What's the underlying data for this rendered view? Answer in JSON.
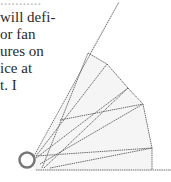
{
  "text_lines": [
    "...........",
    "will defi-",
    "or fan",
    "ures on",
    "ice at",
    "t. I"
  ],
  "diagram": {
    "pivot": {
      "x": 27,
      "y": 160,
      "r": 8
    },
    "stroke_color": "#707070",
    "fill_color": "#f4f4f4"
  }
}
